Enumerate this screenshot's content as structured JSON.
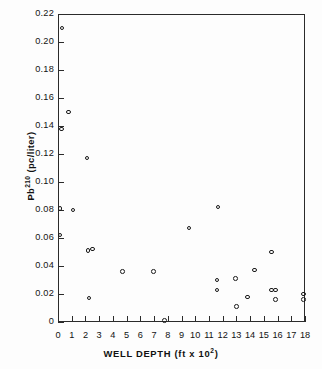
{
  "chart_data": {
    "type": "scatter",
    "title": "",
    "xlabel": "WELL DEPTH (ft x 10²)",
    "xlabel_base": "WELL DEPTH (ft x 10",
    "xlabel_exp": "2",
    "xlabel_tail": ")",
    "ylabel": "Pb210 (pc/liter)",
    "ylabel_base": "Pb",
    "ylabel_exp": "210",
    "ylabel_tail": " (pc/liter)",
    "xlim": [
      0,
      18
    ],
    "ylim": [
      0,
      0.22
    ],
    "grid": false,
    "legend": "none",
    "marker": "open-circle",
    "xticks": [
      0,
      1,
      2,
      3,
      4,
      5,
      6,
      7,
      8,
      9,
      10,
      11,
      12,
      13,
      14,
      15,
      16,
      17,
      18
    ],
    "xtick_labels": [
      "0",
      "1",
      "2",
      "3",
      "4",
      "5",
      "6",
      "7",
      "8",
      "9",
      "10",
      "11",
      "12",
      "13",
      "14",
      "15",
      "16",
      "17",
      "18"
    ],
    "yticks": [
      0,
      0.02,
      0.04,
      0.06,
      0.08,
      0.1,
      0.12,
      0.14,
      0.16,
      0.18,
      0.2,
      0.22
    ],
    "ytick_labels": [
      "0",
      "0.02",
      "0.04",
      "0.06",
      "0.08",
      "0.10",
      "0.12",
      "0.14",
      "0.16",
      "0.18",
      "0.20",
      "0.22"
    ],
    "x": [
      0.3,
      0.75,
      0.25,
      2.1,
      0.15,
      1.1,
      0.15,
      2.2,
      2.5,
      2.25,
      4.7,
      6.95,
      7.75,
      11.65,
      9.55,
      11.6,
      11.6,
      12.95,
      13.0,
      13.8,
      14.3,
      15.55,
      15.55,
      15.85,
      15.85,
      17.9,
      17.9
    ],
    "y": [
      0.21,
      0.15,
      0.138,
      0.117,
      0.081,
      0.08,
      0.062,
      0.051,
      0.052,
      0.017,
      0.036,
      0.036,
      0.001,
      0.082,
      0.067,
      0.03,
      0.023,
      0.031,
      0.011,
      0.018,
      0.037,
      0.05,
      0.023,
      0.023,
      0.016,
      0.02,
      0.016
    ],
    "n_points": 27
  }
}
